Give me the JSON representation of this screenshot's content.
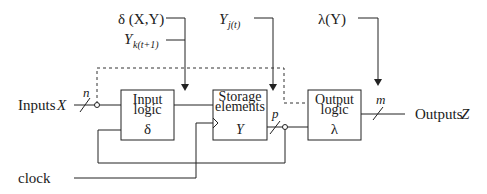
{
  "diagram": {
    "blocks": {
      "input_logic": {
        "line1": "Input",
        "line2": "logic",
        "symbol": "δ"
      },
      "storage": {
        "line1": "Storage",
        "line2": "elements",
        "symbol": "Y"
      },
      "output_logic": {
        "line1": "Output",
        "line2": "logic",
        "symbol": "λ"
      }
    },
    "labels": {
      "inputs": "Inputs ",
      "inputs_var": "X",
      "outputs": "Outputs ",
      "outputs_var": "Z",
      "clock": "clock",
      "n": "n",
      "p": "p",
      "m": "m"
    },
    "annotations": {
      "delta_func": "δ (X,Y)",
      "y_next_base": "Y",
      "y_next_sub": "k(t+1)",
      "y_current_base": "Y",
      "y_current_sub": "j(t)",
      "lambda_func": "λ(Y)"
    },
    "colors": {
      "stroke": "#222222",
      "text": "#1a1a1a",
      "background": "#ffffff"
    }
  }
}
